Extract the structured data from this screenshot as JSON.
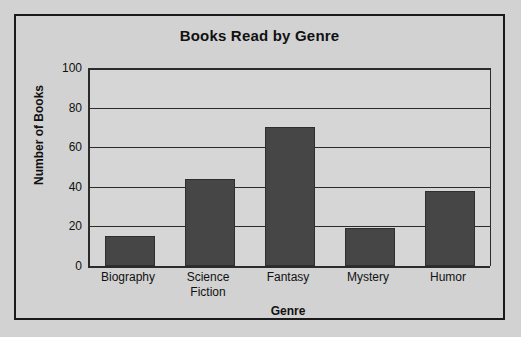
{
  "chart_data": {
    "type": "bar",
    "title": "Books Read by Genre",
    "xlabel": "Genre",
    "ylabel": "Number of Books",
    "categories": [
      "Biography",
      "Science Fiction",
      "Fantasy",
      "Mystery",
      "Humor"
    ],
    "category_lines": [
      [
        "Biography"
      ],
      [
        "Science",
        "Fiction"
      ],
      [
        "Fantasy"
      ],
      [
        "Mystery"
      ],
      [
        "Humor"
      ]
    ],
    "values": [
      15,
      44,
      70,
      19,
      38
    ],
    "ylim": [
      0,
      100
    ],
    "yticks": [
      0,
      20,
      40,
      60,
      80,
      100
    ],
    "ytick_labels": [
      "0",
      "20",
      "40",
      "60",
      "80",
      "100"
    ],
    "grid": true,
    "grid_axis": "y",
    "legend": false,
    "bar_color": "#464646",
    "bar_edge_color": "#2e2e2e",
    "plot_background": "#d6d6d6",
    "page_background": "#d2d2d2",
    "axis_color": "#2b2b2b",
    "frame_border_color": "#1a1a1a",
    "text_color": "#111111"
  }
}
